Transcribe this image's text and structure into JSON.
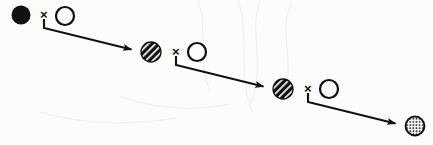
{
  "figure": {
    "kind": "particle-reaction-cascade",
    "background_color": "#fcfcfb",
    "ink_color": "#111111",
    "width": 433,
    "height": 145,
    "operator_symbol": "×",
    "operator_count": 3,
    "step_count": 3
  },
  "nodes": [
    {
      "id": "node-1",
      "role": "initial-particle",
      "fill_style": "solid-black",
      "label": "",
      "cx": 21,
      "cy": 15,
      "r": 9.5
    },
    {
      "id": "node-2",
      "role": "product-particle",
      "fill_style": "diagonal-hatch",
      "label": "",
      "cx": 151,
      "cy": 52,
      "r": 10
    },
    {
      "id": "node-3",
      "role": "product-particle",
      "fill_style": "diagonal-hatch",
      "label": "",
      "cx": 283,
      "cy": 89,
      "r": 10
    },
    {
      "id": "node-4",
      "role": "final-particle",
      "fill_style": "stippled-dots",
      "label": "",
      "cx": 415,
      "cy": 126,
      "r": 10
    }
  ],
  "reactants": [
    {
      "id": "reactant-1",
      "fill_style": "open-outline",
      "label": "",
      "cx": 65,
      "cy": 16,
      "r": 10
    },
    {
      "id": "reactant-2",
      "fill_style": "open-outline",
      "label": "",
      "cx": 197,
      "cy": 52,
      "r": 10
    },
    {
      "id": "reactant-3",
      "fill_style": "open-outline",
      "label": "",
      "cx": 329,
      "cy": 89,
      "r": 10
    }
  ],
  "operators": [
    {
      "id": "operator-1",
      "symbol": "×",
      "x": 40,
      "y": 8
    },
    {
      "id": "operator-2",
      "symbol": "×",
      "x": 172,
      "y": 45
    },
    {
      "id": "operator-3",
      "symbol": "×",
      "x": 304,
      "y": 82
    }
  ],
  "arrows": [
    {
      "id": "arrow-1",
      "from": "operator-1",
      "to": "node-2",
      "stem_x": 44,
      "stem_top_y": 19,
      "elbow_y": 28,
      "tip_x": 138,
      "tip_y": 52
    },
    {
      "id": "arrow-2",
      "from": "operator-2",
      "to": "node-3",
      "stem_x": 176,
      "stem_top_y": 56,
      "elbow_y": 65,
      "tip_x": 270,
      "tip_y": 89
    },
    {
      "id": "arrow-3",
      "from": "operator-3",
      "to": "node-4",
      "stem_x": 308,
      "stem_top_y": 93,
      "elbow_y": 102,
      "tip_x": 402,
      "tip_y": 126
    }
  ]
}
